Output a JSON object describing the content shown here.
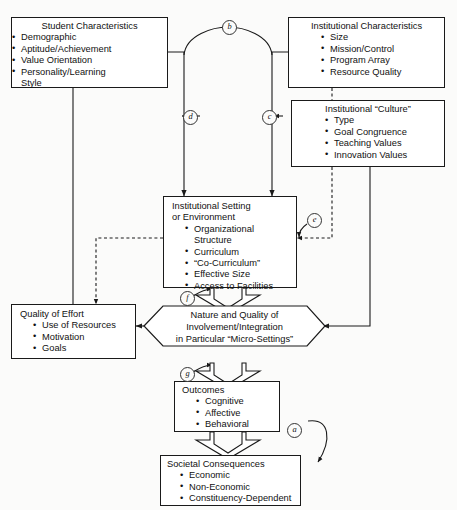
{
  "diagram": {
    "nodes": {
      "student_characteristics": {
        "title": "Student Characteristics",
        "items": [
          "Demographic",
          "Aptitude/Achievement",
          "Value Orientation",
          "Personality/Learning Style"
        ]
      },
      "institutional_characteristics": {
        "title": "Institutional Characteristics",
        "items": [
          "Size",
          "Mission/Control",
          "Program Array",
          "Resource Quality"
        ]
      },
      "institutional_culture": {
        "title": "Institutional “Culture”",
        "items": [
          "Type",
          "Goal Congruence",
          "Teaching Values",
          "Innovation Values"
        ]
      },
      "institutional_setting": {
        "title_line1": "Institutional Setting",
        "title_line2": "or Environment",
        "items": [
          "Organizational Structure",
          "Curriculum",
          "“Co-Curriculum”",
          "Effective Size",
          "Access to Facilities"
        ]
      },
      "quality_of_effort": {
        "title": "Quality of Effort",
        "items": [
          "Use of Resources",
          "Motivation",
          "Goals"
        ]
      },
      "nature_and_quality": {
        "line1": "Nature and Quality of",
        "line2": "Involvement/Integration",
        "line3": "in Particular “Micro-Settings”"
      },
      "outcomes": {
        "title": "Outcomes",
        "items": [
          "Cognitive",
          "Affective",
          "Behavioral"
        ]
      },
      "societal_consequences": {
        "title": "Societal Consequences",
        "items": [
          "Economic",
          "Non-Economic",
          "Constituency-Dependent"
        ]
      }
    },
    "connector_tags": {
      "a": "a",
      "b": "b",
      "c": "c",
      "d": "d",
      "e": "e",
      "f": "f",
      "g": "g"
    },
    "colors": {
      "stroke": "#1a1a1a",
      "background": "#fbfbfa",
      "box_fill": "#ffffff",
      "text": "#111111"
    }
  }
}
